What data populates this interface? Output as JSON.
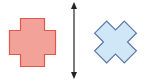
{
  "diagram": {
    "type": "reflection-transformation",
    "shapes": [
      {
        "name": "original-cross",
        "kind": "plus-cross",
        "fill": "#f3a29a",
        "stroke": "#e0584c"
      },
      {
        "name": "transformed-cross",
        "kind": "x-cross",
        "fill": "#cfe7f7",
        "stroke": "#5a76a8"
      }
    ],
    "axis": {
      "name": "mirror-line",
      "orientation": "vertical",
      "arrowheads": "both",
      "color": "#222222"
    }
  }
}
